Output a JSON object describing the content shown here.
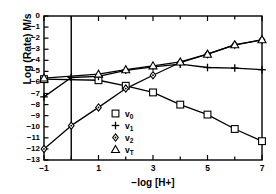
{
  "chart_data": {
    "type": "line",
    "title": "",
    "xlabel": "−log [H+]",
    "ylabel": "Log (Rate) M/s",
    "xlim": [
      -1,
      7
    ],
    "ylim": [
      -13,
      0
    ],
    "xticks": [
      -1,
      0,
      1,
      2,
      3,
      4,
      5,
      6,
      7
    ],
    "xtick_labels": [
      "−1",
      "",
      "1",
      "",
      "3",
      "",
      "5",
      "",
      "7"
    ],
    "yticks": [
      0,
      -1,
      -2,
      -3,
      -4,
      -5,
      -6,
      -7,
      -8,
      -9,
      -10,
      -11,
      -12,
      -13
    ],
    "ytick_labels": [
      "0",
      "−1",
      "−2",
      "−3",
      "−4",
      "−5",
      "−6",
      "−7",
      "−8",
      "−9",
      "−10",
      "−11",
      "−12",
      "−13"
    ],
    "grid": false,
    "legend_position": "center",
    "vertical_reference_line_x": 0,
    "series": [
      {
        "name": "v₀",
        "label": "v0",
        "marker": "square",
        "color": "#000000",
        "x": [
          -1,
          1,
          2,
          3,
          4,
          5,
          6,
          7
        ],
        "y": [
          -5.7,
          -5.8,
          -6.3,
          -6.9,
          -8.0,
          -8.9,
          -10.2,
          -11.3
        ]
      },
      {
        "name": "v₁",
        "label": "v1",
        "marker": "plus",
        "color": "#000000",
        "x": [
          -1,
          0,
          1,
          2,
          3,
          4,
          5,
          6,
          7
        ],
        "y": [
          -7.3,
          -5.55,
          -5.45,
          -4.9,
          -4.6,
          -4.35,
          -4.65,
          -4.7,
          -4.85
        ]
      },
      {
        "name": "v₂",
        "label": "v2",
        "marker": "diamond",
        "color": "#000000",
        "x": [
          -1,
          0,
          1,
          2,
          3,
          4,
          5,
          6,
          7
        ],
        "y": [
          -12.0,
          -9.9,
          -8.25,
          -6.55,
          -5.35,
          -4.2,
          -3.45,
          -2.6,
          -2.15
        ]
      },
      {
        "name": "v_T",
        "label": "vT",
        "marker": "triangle",
        "color": "#000000",
        "x": [
          -1,
          1,
          2,
          3,
          4,
          5,
          6,
          7
        ],
        "y": [
          -5.6,
          -5.25,
          -4.85,
          -4.5,
          -4.15,
          -3.45,
          -2.6,
          -2.15
        ]
      }
    ],
    "legend": [
      {
        "marker": "square",
        "label": "v",
        "sub": "0"
      },
      {
        "marker": "plus",
        "label": "v",
        "sub": "1"
      },
      {
        "marker": "diamond",
        "label": "v",
        "sub": "2"
      },
      {
        "marker": "triangle",
        "label": "v",
        "sub": "T"
      }
    ]
  }
}
